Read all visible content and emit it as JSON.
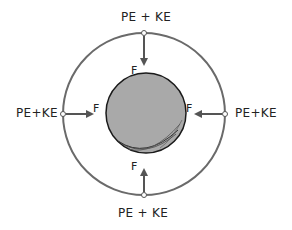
{
  "diagram": {
    "labels": {
      "top": "PE + KE",
      "bottom": "PE + KE",
      "left": "PE+KE",
      "right": "PE+KE"
    },
    "force_labels": {
      "top": "F",
      "bottom": "F",
      "left": "F",
      "right": "F"
    },
    "colors": {
      "orbit": "#6a6a6a",
      "planet_fill": "#a9a9a9",
      "planet_outline": "#1a1a1a",
      "arrow": "#555555",
      "text": "#222222"
    }
  }
}
